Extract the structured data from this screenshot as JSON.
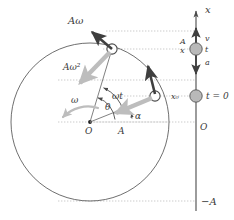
{
  "figure": {
    "colors": {
      "stroke": "#4a4a4a",
      "dotted": "#b0b0b0",
      "ball_fill": "#b9b9b9",
      "ball_stroke": "#555555",
      "arrow_light": "#bdbdbd",
      "arrow_dark": "#3f3f3f",
      "text": "#3a3a3a",
      "background": "#ffffff"
    }
  },
  "circle_diagram": {
    "origin_label": "O",
    "radius_label": "A",
    "angular_velocity_label": "ω",
    "omega_t_label": "ωt",
    "theta_label": "θ",
    "alpha_label": "α",
    "velocity_vector_label": "Aω",
    "acceleration_vector_label": "Aω²"
  },
  "axis": {
    "axis_label": "x",
    "origin_label": "O",
    "amplitude_label": "A",
    "position_label": "x",
    "negative_amplitude_label": "−A",
    "initial_position_label": "x₀",
    "velocity_label": "v",
    "time_label": "t",
    "acceleration_label": "a",
    "initial_time_label": "t = 0"
  }
}
